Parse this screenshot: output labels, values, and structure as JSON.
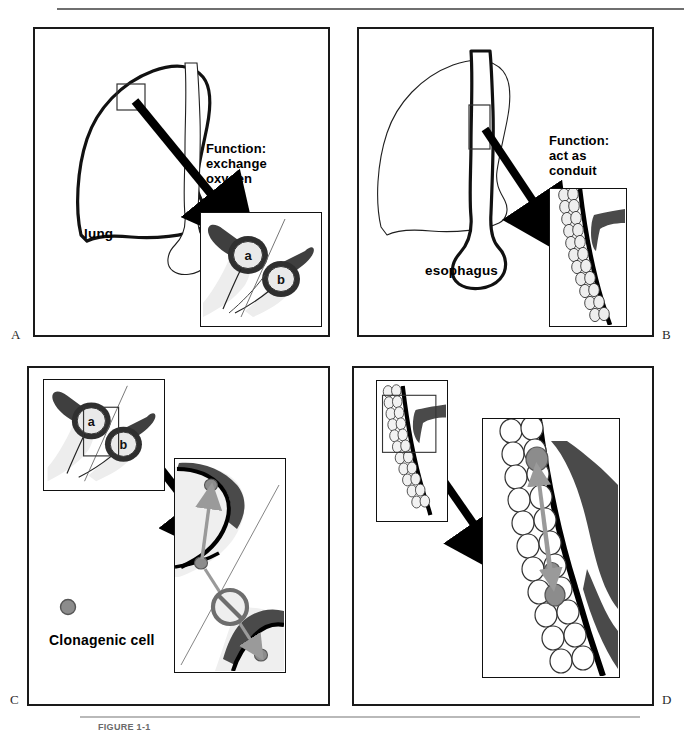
{
  "figure": {
    "caption": "FIGURE 1-1",
    "panel_letters": [
      "A",
      "B",
      "C",
      "D"
    ]
  },
  "panels": {
    "a": {
      "letter": "A",
      "organ_label": "lung",
      "function_label": "Function:\nexchange\noxygen",
      "function_lines": [
        "Function:",
        "exchange",
        "oxygen"
      ],
      "inset_labels": [
        "a",
        "b"
      ],
      "description": "Lung outline with trachea; callout box on upper lobe with arrow to inset of two alveoli labeled a and b"
    },
    "b": {
      "letter": "B",
      "organ_label": "esophagus",
      "function_label": "Function:\nact as\nconduit",
      "function_lines": [
        "Function:",
        "act as",
        "conduit"
      ],
      "description": "Esophagus outline with faint lung behind; callout box on esophagus with arrow to inset of stratified epithelium and vessel"
    },
    "c": {
      "letter": "C",
      "legend_label": "Clonagenic cell",
      "legend_marker": "gray-filled-circle",
      "inset_labels": [
        "a",
        "b"
      ],
      "description": "Alveoli inset labeled a and b with arrow to magnified alveolar wall; gray clonogenic cells with upward arrow allowed and downward arrow blocked by prohibition symbol"
    },
    "d": {
      "letter": "D",
      "description": "Esophageal epithelium inset with arrow to magnified view showing gray clonogenic cells migrating along the basal layer with bidirectional arrows"
    }
  },
  "colors": {
    "ink": "#111111",
    "panel_border": "#1a1a1a",
    "clonogenic_cell_fill": "#8c8c8c",
    "clonogenic_cell_stroke": "#555555",
    "tissue_dark": "#4a4a4a",
    "tissue_light": "#e8e8e8",
    "rule_top": "#6f6f6f",
    "rule_bottom": "#b9b9b9",
    "caption_text": "#6a6a6a",
    "arrow_black": "#000000",
    "arrow_gray": "#9a9a9a"
  }
}
